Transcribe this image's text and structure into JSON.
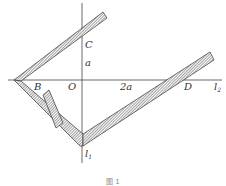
{
  "figure": {
    "caption": "图 1",
    "axes": {
      "vertical": {
        "label": "l",
        "subscript": "1"
      },
      "horizontal": {
        "label": "l",
        "subscript": "2"
      }
    },
    "points": {
      "O": "O",
      "B": "B",
      "C": "C",
      "D": "D"
    },
    "lengths": {
      "OC": "a",
      "OD": "2a"
    },
    "colors": {
      "line": "#444444",
      "hatch": "#555555",
      "background": "#ffffff"
    }
  }
}
